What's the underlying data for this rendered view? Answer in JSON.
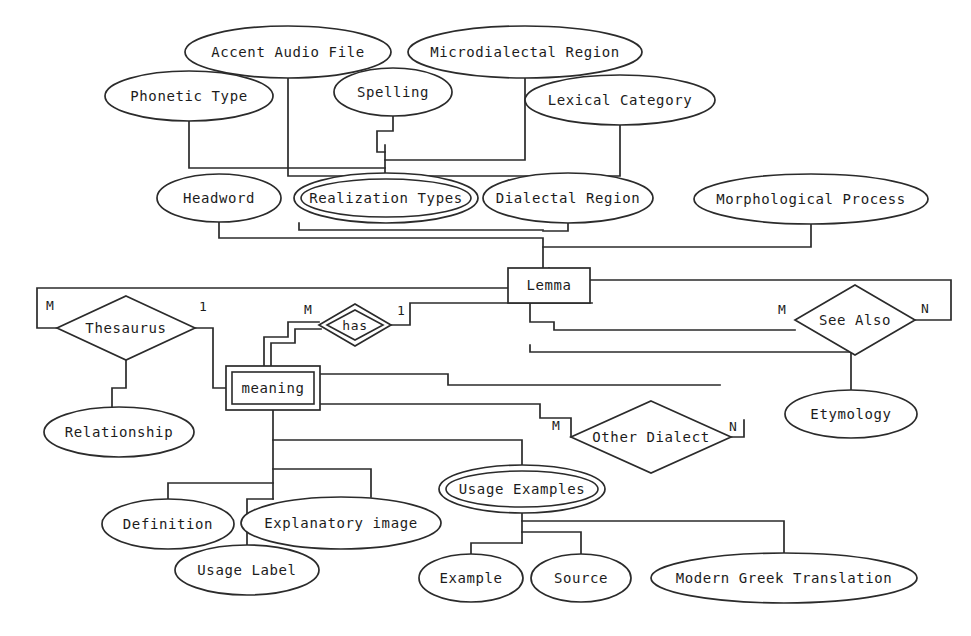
{
  "diagram": {
    "notation": "Chen ER",
    "stroke_color": "#2b2b2b",
    "background_color": "#ffffff",
    "entities": [
      {
        "id": "lemma",
        "label": "Lemma",
        "kind": "entity",
        "x": 549,
        "y": 285,
        "w": 82,
        "h": 35
      },
      {
        "id": "meaning",
        "label": "meaning",
        "kind": "weak-entity",
        "x": 273,
        "y": 388,
        "w": 94,
        "h": 44
      }
    ],
    "relationships": [
      {
        "id": "thesaurus",
        "label": "Thesaurus",
        "kind": "relationship",
        "x": 126,
        "y": 328,
        "rx": 69,
        "ry": 32
      },
      {
        "id": "has",
        "label": "has",
        "kind": "identifying-relationship",
        "x": 355,
        "y": 325,
        "rx": 36,
        "ry": 21
      },
      {
        "id": "see-also",
        "label": "See Also",
        "kind": "relationship",
        "x": 855,
        "y": 320,
        "rx": 60,
        "ry": 35
      },
      {
        "id": "other-dialect",
        "label": "Other Dialect",
        "kind": "relationship",
        "x": 651,
        "y": 437,
        "rx": 80,
        "ry": 36
      }
    ],
    "attributes": [
      {
        "id": "accent-audio-file",
        "label": "Accent Audio File",
        "kind": "attribute",
        "x": 288,
        "y": 52,
        "rx": 103,
        "ry": 26
      },
      {
        "id": "microdialectal-region",
        "label": "Microdialectal Region",
        "kind": "attribute",
        "x": 525,
        "y": 52,
        "rx": 117,
        "ry": 26
      },
      {
        "id": "phonetic-type",
        "label": "Phonetic Type",
        "kind": "attribute",
        "x": 189,
        "y": 96,
        "rx": 84,
        "ry": 25
      },
      {
        "id": "spelling",
        "label": "Spelling",
        "kind": "attribute",
        "x": 393,
        "y": 92,
        "rx": 59,
        "ry": 24
      },
      {
        "id": "lexical-category",
        "label": "Lexical Category",
        "kind": "attribute",
        "x": 620,
        "y": 100,
        "rx": 95,
        "ry": 25
      },
      {
        "id": "headword",
        "label": "Headword",
        "kind": "attribute",
        "x": 219,
        "y": 198,
        "rx": 62,
        "ry": 24
      },
      {
        "id": "realization-types",
        "label": "Realization Types",
        "kind": "multivalued-attribute",
        "x": 386,
        "y": 198,
        "rx": 92,
        "ry": 25
      },
      {
        "id": "dialectal-region",
        "label": "Dialectal Region",
        "kind": "attribute",
        "x": 568,
        "y": 198,
        "rx": 85,
        "ry": 25
      },
      {
        "id": "morphological-process",
        "label": "Morphological Process",
        "kind": "attribute",
        "x": 811,
        "y": 199,
        "rx": 117,
        "ry": 25
      },
      {
        "id": "relationship",
        "label": "Relationship",
        "kind": "attribute",
        "x": 119,
        "y": 432,
        "rx": 75,
        "ry": 25
      },
      {
        "id": "etymology",
        "label": "Etymology",
        "kind": "attribute",
        "x": 851,
        "y": 414,
        "rx": 66,
        "ry": 24
      },
      {
        "id": "definition",
        "label": "Definition",
        "kind": "attribute",
        "x": 168,
        "y": 524,
        "rx": 66,
        "ry": 25
      },
      {
        "id": "explanatory-image",
        "label": "Explanatory image",
        "kind": "attribute",
        "x": 341,
        "y": 523,
        "rx": 100,
        "ry": 26
      },
      {
        "id": "usage-label",
        "label": "Usage Label",
        "kind": "attribute",
        "x": 247,
        "y": 570,
        "rx": 72,
        "ry": 25
      },
      {
        "id": "usage-examples",
        "label": "Usage Examples",
        "kind": "multivalued-attribute",
        "x": 522,
        "y": 489,
        "rx": 83,
        "ry": 24
      },
      {
        "id": "example",
        "label": "Example",
        "kind": "attribute",
        "x": 471,
        "y": 578,
        "rx": 52,
        "ry": 24
      },
      {
        "id": "source",
        "label": "Source",
        "kind": "attribute",
        "x": 581,
        "y": 578,
        "rx": 50,
        "ry": 24
      },
      {
        "id": "modern-greek-translation",
        "label": "Modern Greek Translation",
        "kind": "attribute",
        "x": 784,
        "y": 578,
        "rx": 133,
        "ry": 25
      }
    ],
    "cardinality_labels": [
      {
        "id": "thesaurus-m",
        "text": "M",
        "x": 50,
        "y": 306,
        "edge": "thesaurus-left"
      },
      {
        "id": "thesaurus-1",
        "text": "1",
        "x": 203,
        "y": 307,
        "edge": "thesaurus-right"
      },
      {
        "id": "has-m",
        "text": "M",
        "x": 308,
        "y": 310,
        "edge": "has-left"
      },
      {
        "id": "has-1",
        "text": "1",
        "x": 401,
        "y": 311,
        "edge": "has-right"
      },
      {
        "id": "see-also-m",
        "text": "M",
        "x": 782,
        "y": 310,
        "edge": "see-also-left"
      },
      {
        "id": "see-also-n",
        "text": "N",
        "x": 925,
        "y": 309,
        "edge": "see-also-right"
      },
      {
        "id": "other-dialect-m",
        "text": "M",
        "x": 556,
        "y": 426,
        "edge": "other-dialect-left"
      },
      {
        "id": "other-dialect-n",
        "text": "N",
        "x": 733,
        "y": 427,
        "edge": "other-dialect-right"
      }
    ],
    "connections": [
      {
        "id": "accent-audio-to-hub",
        "from": "accent-audio-file",
        "to": "realization-hub"
      },
      {
        "id": "phonetic-type-to-hub",
        "from": "phonetic-type",
        "to": "realization-hub"
      },
      {
        "id": "spelling-to-hub",
        "from": "spelling",
        "to": "realization-hub"
      },
      {
        "id": "microdialectal-to-hub",
        "from": "microdialectal-region",
        "to": "realization-hub"
      },
      {
        "id": "lexical-category-to-hub",
        "from": "lexical-category",
        "to": "realization-hub"
      },
      {
        "id": "hub-to-realization-types",
        "from": "realization-hub",
        "to": "realization-types"
      },
      {
        "id": "headword-to-lemma",
        "from": "headword",
        "to": "lemma"
      },
      {
        "id": "realization-types-to-lemma",
        "from": "realization-types",
        "to": "lemma"
      },
      {
        "id": "dialectal-region-to-lemma",
        "from": "dialectal-region",
        "to": "lemma"
      },
      {
        "id": "morphological-process-to-lemma",
        "from": "morphological-process",
        "to": "lemma"
      },
      {
        "id": "lemma-to-thesaurus",
        "from": "lemma",
        "to": "thesaurus"
      },
      {
        "id": "thesaurus-to-meaning",
        "from": "thesaurus",
        "to": "meaning"
      },
      {
        "id": "thesaurus-to-relationship",
        "from": "thesaurus",
        "to": "relationship"
      },
      {
        "id": "meaning-to-has",
        "from": "meaning",
        "to": "has"
      },
      {
        "id": "has-to-lemma",
        "from": "has",
        "to": "lemma"
      },
      {
        "id": "lemma-to-see-also",
        "from": "lemma",
        "to": "see-also"
      },
      {
        "id": "see-also-to-etymology",
        "from": "see-also",
        "to": "etymology"
      },
      {
        "id": "meaning-to-other-dialect",
        "from": "meaning",
        "to": "other-dialect"
      },
      {
        "id": "other-dialect-to-usage",
        "from": "other-dialect",
        "to": "usage-examples"
      },
      {
        "id": "meaning-to-definition",
        "from": "meaning",
        "to": "definition"
      },
      {
        "id": "meaning-to-usage-label",
        "from": "meaning",
        "to": "usage-label"
      },
      {
        "id": "meaning-to-explanatory-image",
        "from": "meaning",
        "to": "explanatory-image"
      },
      {
        "id": "meaning-to-usage-examples",
        "from": "meaning",
        "to": "usage-examples"
      },
      {
        "id": "usage-examples-to-example",
        "from": "usage-examples",
        "to": "example"
      },
      {
        "id": "usage-examples-to-source",
        "from": "usage-examples",
        "to": "source"
      },
      {
        "id": "usage-examples-to-modern-greek",
        "from": "usage-examples",
        "to": "modern-greek-translation"
      }
    ]
  }
}
